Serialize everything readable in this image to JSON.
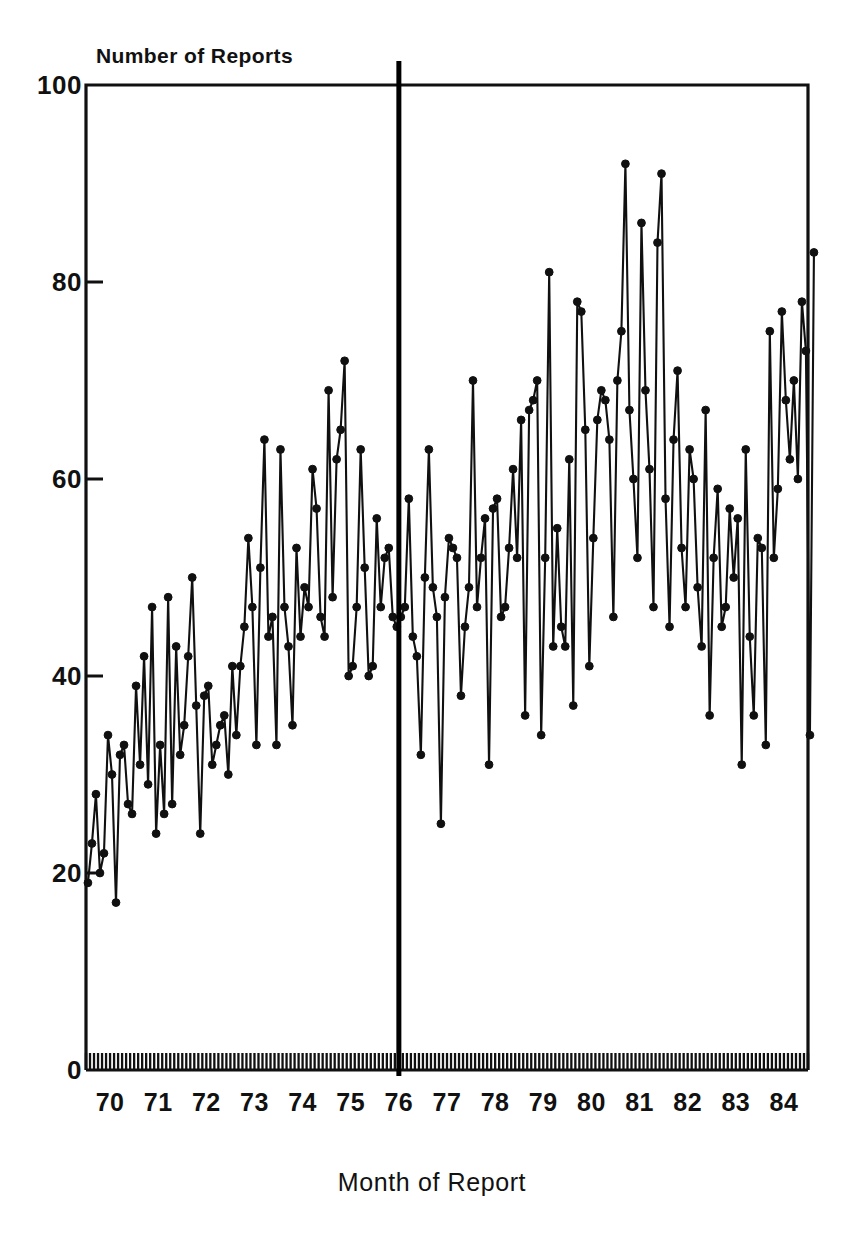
{
  "chart_data": {
    "type": "line",
    "title": "",
    "ylabel": "Number of Reports",
    "xlabel": "Month of Report",
    "ylim": [
      0,
      100
    ],
    "yticks": [
      0,
      20,
      40,
      60,
      80,
      100
    ],
    "ytick_labels": [
      "0",
      "20",
      "40",
      "60",
      "80",
      "100"
    ],
    "xlim": [
      1970.0,
      1985.0
    ],
    "xtick_labels": [
      "70",
      "71",
      "72",
      "73",
      "74",
      "75",
      "76",
      "77",
      "78",
      "79",
      "80",
      "81",
      "82",
      "83",
      "84"
    ],
    "xticks": [
      1970,
      1971,
      1972,
      1973,
      1974,
      1975,
      1976,
      1977,
      1978,
      1979,
      1980,
      1981,
      1982,
      1983,
      1984
    ],
    "x_minor_tick_interval_months": 1,
    "grid": false,
    "legend": null,
    "marker": "filled-circle",
    "line_color": "#101010",
    "frame_color": "#101010",
    "annotations": [
      {
        "name": "intervention-line",
        "type": "vertical-line",
        "x": 1976.5,
        "label": "",
        "color": "#000000",
        "extends_above_frame": true
      }
    ],
    "x_start": 1970.04,
    "x_step_months": 1,
    "n_points": 180,
    "values": [
      19,
      23,
      28,
      20,
      22,
      34,
      30,
      17,
      32,
      33,
      27,
      26,
      39,
      31,
      42,
      29,
      47,
      24,
      33,
      26,
      48,
      27,
      43,
      32,
      35,
      42,
      50,
      37,
      24,
      38,
      39,
      31,
      33,
      35,
      36,
      30,
      41,
      34,
      41,
      45,
      54,
      47,
      33,
      51,
      64,
      44,
      46,
      33,
      63,
      47,
      43,
      35,
      53,
      44,
      49,
      47,
      61,
      57,
      46,
      44,
      69,
      48,
      62,
      65,
      72,
      40,
      41,
      47,
      63,
      51,
      40,
      41,
      56,
      47,
      52,
      53,
      46,
      45,
      46,
      47,
      58,
      44,
      42,
      32,
      50,
      63,
      49,
      46,
      25,
      48,
      54,
      53,
      52,
      38,
      45,
      49,
      70,
      47,
      52,
      56,
      31,
      57,
      58,
      46,
      47,
      53,
      61,
      52,
      66,
      36,
      67,
      68,
      70,
      34,
      52,
      81,
      43,
      55,
      45,
      43,
      62,
      37,
      78,
      77,
      65,
      41,
      54,
      66,
      69,
      68,
      64,
      46,
      70,
      75,
      92,
      67,
      60,
      52,
      86,
      69,
      61,
      47,
      84,
      91,
      58,
      45,
      64,
      71,
      53,
      47,
      63,
      60,
      49,
      43,
      67,
      36,
      52,
      59,
      45,
      47,
      57,
      50,
      56,
      31,
      63,
      44,
      36,
      54,
      53,
      33,
      75,
      52,
      59,
      77,
      68,
      62,
      70,
      60,
      78,
      73,
      34,
      83
    ]
  },
  "axis": {
    "ytitle": "Number of Reports",
    "xtitle": "Month of Report"
  }
}
